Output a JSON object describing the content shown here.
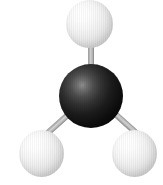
{
  "figure": {
    "name": "molecule-ball-and-stick-model",
    "description": "Ball-and-stick 3D model of a molecule: one dark central atom bonded to three light atoms",
    "background_color": "#ffffff",
    "width": 163,
    "height": 185
  },
  "atoms": [
    {
      "id": "atom-top",
      "label": "",
      "role": "terminal-atom",
      "color": "#f0f0f0",
      "shading": "white-sphere",
      "position": {
        "x": 66,
        "y": 0,
        "width": 47,
        "height": 48
      }
    },
    {
      "id": "atom-center",
      "label": "",
      "role": "central-atom",
      "color": "#000000",
      "shading": "black-sphere",
      "position": {
        "x": 59,
        "y": 64,
        "width": 64,
        "height": 64
      }
    },
    {
      "id": "atom-bottom-left",
      "label": "",
      "role": "terminal-atom",
      "color": "#f0f0f0",
      "shading": "white-sphere",
      "position": {
        "x": 19,
        "y": 130,
        "width": 45,
        "height": 47
      }
    },
    {
      "id": "atom-bottom-right",
      "label": "",
      "role": "terminal-atom",
      "color": "#f0f0f0",
      "shading": "white-sphere",
      "position": {
        "x": 112,
        "y": 130,
        "width": 45,
        "height": 47
      }
    }
  ],
  "bonds": [
    {
      "id": "bond-center-top",
      "from": "atom-center",
      "to": "atom-top",
      "color": "#b4b4b4",
      "angle_deg": 0
    },
    {
      "id": "bond-center-bottom-left",
      "from": "atom-center",
      "to": "atom-bottom-left",
      "color": "#b4b4b4",
      "angle_deg": 48
    },
    {
      "id": "bond-center-bottom-right",
      "from": "atom-center",
      "to": "atom-bottom-right",
      "color": "#b4b4b4",
      "angle_deg": -48
    }
  ]
}
